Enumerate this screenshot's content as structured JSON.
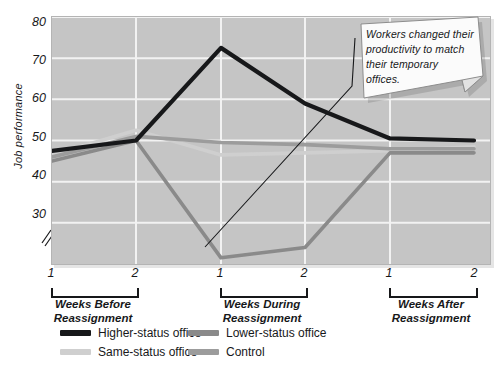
{
  "chart_data": {
    "type": "line",
    "title": "",
    "xlabel": "",
    "ylabel": "Job performance",
    "ylim": [
      20,
      80
    ],
    "yticks": [
      30,
      40,
      50,
      60,
      70,
      80
    ],
    "y_axis_break": true,
    "grid": true,
    "legend_position": "bottom",
    "x": [
      1,
      2,
      1,
      2,
      1,
      2
    ],
    "categories": [
      "1",
      "2",
      "1",
      "2",
      "1",
      "2"
    ],
    "group_labels": [
      "Weeks Before\nReassignment",
      "Weeks During\nReassignment",
      "Weeks After\nReassignment"
    ],
    "series": [
      {
        "name": "Higher-status office",
        "color": "#17181a",
        "values": [
          47.5,
          50.0,
          72.5,
          59.0,
          50.5,
          50.0
        ]
      },
      {
        "name": "Lower-status office",
        "color": "#8a8a8a",
        "values": [
          45.0,
          50.0,
          21.5,
          24.0,
          47.0,
          47.0
        ]
      },
      {
        "name": "Same-status office",
        "color": "#cfcfcf",
        "values": [
          46.5,
          52.5,
          46.5,
          47.0,
          47.5,
          48.5
        ]
      },
      {
        "name": "Control",
        "color": "#9c9c9c",
        "values": [
          46.0,
          51.0,
          49.5,
          49.0,
          48.0,
          48.0
        ]
      }
    ],
    "annotations": [
      {
        "text": "Workers changed their productivity to match their temporary offices.",
        "points_to": "During week 2 region"
      }
    ]
  },
  "axis": {
    "ytitle": "Job performance",
    "yticks": [
      "80",
      "70",
      "60",
      "50",
      "40",
      "30"
    ],
    "xticks": [
      "1",
      "2",
      "1",
      "2",
      "1",
      "2"
    ]
  },
  "groups": [
    {
      "line1": "Weeks Before",
      "line2": "Reassignment"
    },
    {
      "line1": "Weeks During",
      "line2": "Reassignment"
    },
    {
      "line1": "Weeks After",
      "line2": "Reassignment"
    }
  ],
  "legend": {
    "items": [
      {
        "label": "Higher-status office",
        "color": "#17181a"
      },
      {
        "label": "Lower-status office",
        "color": "#8a8a8a"
      },
      {
        "label": "Same-status office",
        "color": "#cfcfcf"
      },
      {
        "label": "Control",
        "color": "#9c9c9c"
      }
    ]
  },
  "callout": {
    "text": "Workers changed their productivity to match their temporary offices."
  },
  "colors": {
    "plot_background": "#c5c5c5",
    "gridline": "#f2f2f2",
    "text": "#17181a",
    "note_fill": "#fbfbfb"
  }
}
